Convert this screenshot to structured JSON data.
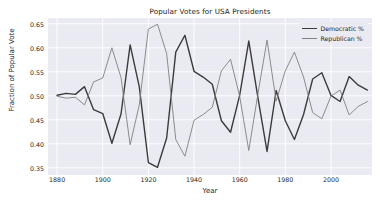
{
  "chart_data": {
    "type": "line",
    "title": "Popular Votes for USA Presidents",
    "xlabel": "Year",
    "ylabel": "Fraction of Popular Vote",
    "xlim": [
      1876,
      2018
    ],
    "ylim": [
      0.335,
      0.662
    ],
    "xticks": [
      1880,
      1900,
      1920,
      1940,
      1960,
      1980,
      2000
    ],
    "yticks": [
      0.35,
      0.4,
      0.45,
      0.5,
      0.55,
      0.6,
      0.65
    ],
    "ytick_labels": [
      "0.35",
      "0.40",
      "0.45",
      "0.50",
      "0.55",
      "0.60",
      "0.65"
    ],
    "xtick_labels": [
      "1880",
      "1900",
      "1920",
      "1940",
      "1960",
      "1980",
      "2000"
    ],
    "grid": true,
    "legend_position": "upper right",
    "x": [
      1880,
      1884,
      1888,
      1892,
      1896,
      1900,
      1904,
      1908,
      1912,
      1916,
      1920,
      1924,
      1928,
      1932,
      1936,
      1940,
      1944,
      1948,
      1952,
      1956,
      1960,
      1964,
      1968,
      1972,
      1976,
      1980,
      1984,
      1988,
      1992,
      1996,
      2000,
      2004,
      2008,
      2012,
      2016
    ],
    "series": [
      {
        "name": "Democratic %",
        "color": "#3b3b3b",
        "linewidth": 1.4,
        "values": [
          0.501,
          0.505,
          0.503,
          0.519,
          0.471,
          0.463,
          0.401,
          0.462,
          0.606,
          0.519,
          0.361,
          0.351,
          0.412,
          0.591,
          0.626,
          0.551,
          0.539,
          0.524,
          0.448,
          0.424,
          0.501,
          0.614,
          0.496,
          0.384,
          0.511,
          0.448,
          0.409,
          0.461,
          0.535,
          0.548,
          0.501,
          0.488,
          0.54,
          0.522,
          0.512
        ]
      },
      {
        "name": "Republican %",
        "color": "#808080",
        "linewidth": 0.9,
        "values": [
          0.499,
          0.495,
          0.497,
          0.481,
          0.529,
          0.537,
          0.6,
          0.538,
          0.398,
          0.481,
          0.639,
          0.649,
          0.588,
          0.409,
          0.374,
          0.449,
          0.461,
          0.476,
          0.552,
          0.576,
          0.499,
          0.386,
          0.504,
          0.616,
          0.489,
          0.552,
          0.591,
          0.539,
          0.465,
          0.452,
          0.499,
          0.512,
          0.46,
          0.478,
          0.488
        ]
      }
    ]
  },
  "legend": {
    "entries": [
      {
        "label": "Democratic %"
      },
      {
        "label": "Republican %"
      }
    ]
  }
}
